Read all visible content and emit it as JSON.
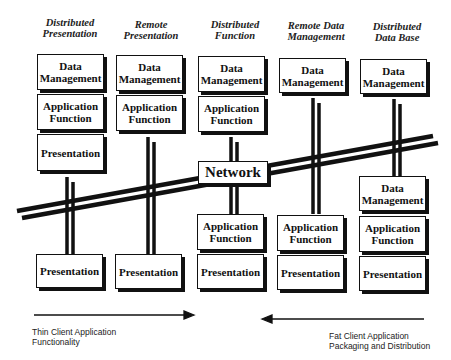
{
  "columns": [
    {
      "title": "Distributed Presentation",
      "title_lines": [
        "Distributed",
        "Presentation"
      ],
      "server_boxes": [
        "Data Management",
        "Application Function",
        "Presentation"
      ],
      "client_boxes": [
        "Presentation"
      ]
    },
    {
      "title": "Remote Presentation",
      "title_lines": [
        "Remote",
        "Presentation"
      ],
      "server_boxes": [
        "Data Management",
        "Application Function"
      ],
      "client_boxes": [
        "Presentation"
      ]
    },
    {
      "title": "Distributed Function",
      "title_lines": [
        "Distributed",
        "Function"
      ],
      "server_boxes": [
        "Data Management",
        "Application Function"
      ],
      "client_boxes": [
        "Application Function",
        "Presentation"
      ]
    },
    {
      "title": "Remote Data Management",
      "title_lines": [
        "Remote Data",
        "Management"
      ],
      "server_boxes": [
        "Data Management"
      ],
      "client_boxes": [
        "Application Function",
        "Presentation"
      ]
    },
    {
      "title": "Distributed Data Base",
      "title_lines": [
        "Distributed",
        "Data Base"
      ],
      "server_boxes": [
        "Data Management"
      ],
      "client_boxes": [
        "Data Management",
        "Application Function",
        "Presentation"
      ]
    }
  ],
  "network_label": "Network",
  "arrows": {
    "left": {
      "direction": "right",
      "caption_lines": [
        "Thin Client Application",
        "Functionality"
      ]
    },
    "right": {
      "direction": "left",
      "caption_lines": [
        "Fat Client Application",
        "Packaging and Distribution"
      ]
    }
  }
}
